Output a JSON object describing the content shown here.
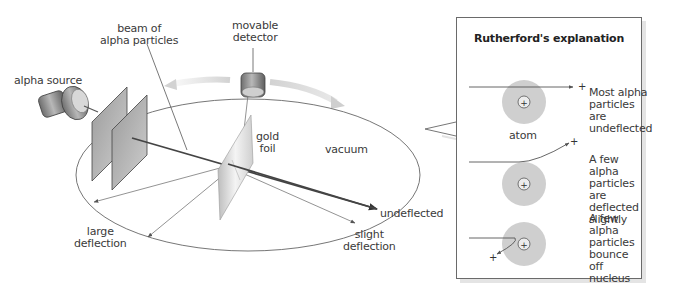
{
  "figure": {
    "apparatus_labels": {
      "alpha_source": "alpha source",
      "beam": "beam of\nalpha particles",
      "detector": "movable\ndetector",
      "gold_foil": "gold\nfoil",
      "vacuum": "vacuum",
      "undeflected": "undeflected",
      "slight_deflection": "slight\ndeflection",
      "large_deflection": "large\ndeflection"
    },
    "explanation_panel": {
      "title": "Rutherford's explanation",
      "atom_label": "atom",
      "nucleus_symbol": "+",
      "particle_symbol": "+",
      "cases": [
        {
          "text": "Most alpha\nparticles are\nundeflected",
          "path": "straight"
        },
        {
          "text": "A few alpha\nparticles are\ndeflected\nslightly",
          "path": "deflected"
        },
        {
          "text": "A few alpha\nparticles\nbounce\noff nucleus",
          "path": "bounce"
        }
      ]
    },
    "colors": {
      "line": "#555555",
      "beam": "#444444",
      "atom_cloud": "#cfcfcf",
      "nucleus": "#e6e6e6",
      "arrow_band": "#d9d9d9",
      "panel_border": "#6a6a6a"
    }
  }
}
